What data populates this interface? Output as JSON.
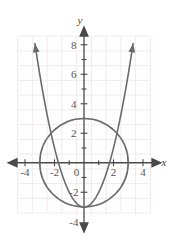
{
  "figure": {
    "title": "",
    "background_color": "#ffffff",
    "curve_color": "#6b6b6b",
    "axis_color": "#4a4a4a",
    "grid_color": "#f0e8ea",
    "label_color": "#555555"
  },
  "axes": {
    "x_axis_label": "x",
    "y_axis_label": "y",
    "x_tick_labels": [
      "-4",
      "-2",
      "0",
      "2",
      "4"
    ],
    "x_tick_values": [
      -4,
      -2,
      0,
      2,
      4
    ],
    "y_tick_labels": [
      "8",
      "6",
      "4",
      "2",
      "-2",
      "-4"
    ],
    "y_tick_values": [
      8,
      6,
      4,
      2,
      -2,
      -4
    ],
    "origin_label": "0",
    "xlim": [
      -4.6,
      4.6
    ],
    "ylim": [
      -4.6,
      8.9
    ],
    "grid": true,
    "grid_step": 1,
    "minor_tick_step": 1,
    "major_label_step": 2,
    "arrowheads": [
      "x-left",
      "x-right",
      "y-up",
      "y-down"
    ]
  },
  "chart_data": {
    "type": "line",
    "title": "",
    "xlabel": "x",
    "ylabel": "y",
    "xlim": [
      -4.6,
      4.6
    ],
    "ylim": [
      -4.6,
      8.9
    ],
    "grid": true,
    "legend": "none",
    "series": [
      {
        "name": "parabola",
        "equation": "y = x^2 - 3",
        "type": "parabola",
        "vertex": [
          0,
          -3
        ],
        "a": 1,
        "roots": [
          -1.732,
          1.732
        ],
        "color": "#6b6b6b",
        "arrow_ends": [
          "left-top",
          "right-top"
        ],
        "x_range": [
          -3.33,
          3.33
        ],
        "points": [
          [
            -3.33,
            8.09
          ],
          [
            -3.0,
            6.0
          ],
          [
            -2.5,
            3.25
          ],
          [
            -2.0,
            1.0
          ],
          [
            -1.5,
            -0.75
          ],
          [
            -1.0,
            -2.0
          ],
          [
            -0.5,
            -2.75
          ],
          [
            0,
            -3
          ],
          [
            0.5,
            -2.75
          ],
          [
            1.0,
            -2.0
          ],
          [
            1.5,
            -0.75
          ],
          [
            2.0,
            1.0
          ],
          [
            2.5,
            3.25
          ],
          [
            3.0,
            6.0
          ],
          [
            3.33,
            8.09
          ]
        ]
      },
      {
        "name": "circle",
        "equation": "x^2 + y^2 = 9",
        "type": "circle",
        "center": [
          0,
          0
        ],
        "radius": 3,
        "color": "#6b6b6b",
        "intercepts": [
          [
            3,
            0
          ],
          [
            -3,
            0
          ],
          [
            0,
            3
          ],
          [
            0,
            -3
          ]
        ]
      }
    ],
    "intersections": [
      [
        -1.732,
        0
      ],
      [
        1.732,
        0
      ],
      [
        0,
        -3
      ]
    ]
  }
}
